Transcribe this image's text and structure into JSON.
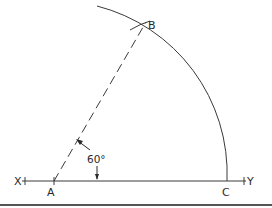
{
  "diagram": {
    "line_color": "#3a3a3a",
    "background": "#ffffff",
    "bottom_rule_color": "#555555",
    "points": {
      "X": {
        "label": "X",
        "x": 22,
        "y": 181
      },
      "Y": {
        "label": "Y",
        "x": 246,
        "y": 181
      },
      "A": {
        "label": "A",
        "x": 54,
        "y": 181
      },
      "B": {
        "label": "B",
        "x": 141,
        "y": 31
      },
      "C": {
        "label": "C",
        "x": 227,
        "y": 181
      }
    },
    "angle": {
      "label": "60°",
      "vertex": "A",
      "degrees": 60
    },
    "arc": {
      "center": "A",
      "radius": 173,
      "description": "Arc of radius AC centered at A, intersecting at B"
    },
    "edges": [
      {
        "from": "X",
        "to": "Y",
        "style": "solid"
      },
      {
        "from": "A",
        "to": "B",
        "style": "dashed"
      }
    ]
  }
}
